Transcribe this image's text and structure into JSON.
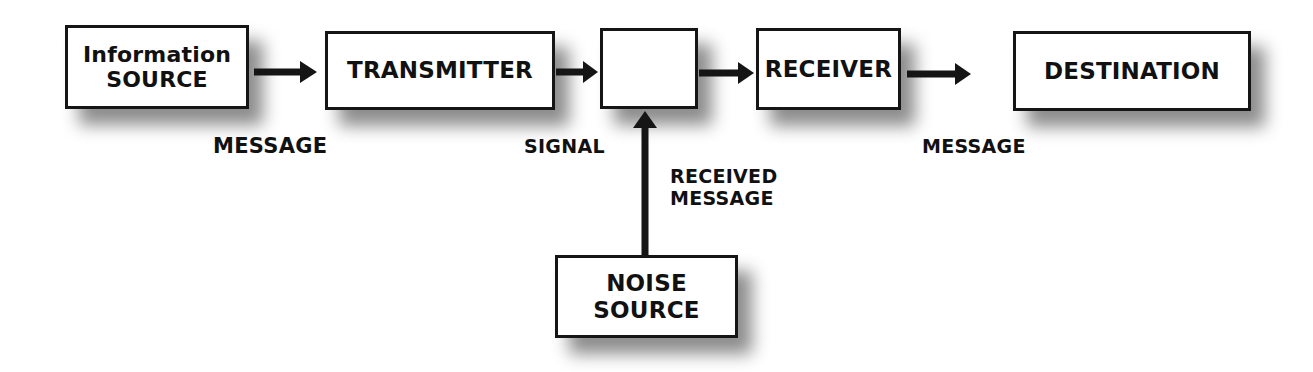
{
  "diagram": {
    "type": "communication-model",
    "nodes": {
      "info_source": {
        "line1": "Information",
        "line2": "SOURCE"
      },
      "transmitter": {
        "label": "TRANSMITTER"
      },
      "channel": {
        "label": ""
      },
      "receiver": {
        "label": "RECEIVER"
      },
      "destination": {
        "label": "DESTINATION"
      },
      "noise_source": {
        "line1": "NOISE",
        "line2": "SOURCE"
      }
    },
    "edge_labels": {
      "message_left": "MESSAGE",
      "signal": "SIGNAL",
      "received_line1": "RECEIVED",
      "received_line2": "MESSAGE",
      "message_right": "MESSAGE"
    },
    "edges": [
      {
        "from": "info_source",
        "to": "transmitter"
      },
      {
        "from": "transmitter",
        "to": "channel"
      },
      {
        "from": "channel",
        "to": "receiver"
      },
      {
        "from": "receiver",
        "to": "destination"
      },
      {
        "from": "noise_source",
        "to": "channel"
      }
    ]
  }
}
